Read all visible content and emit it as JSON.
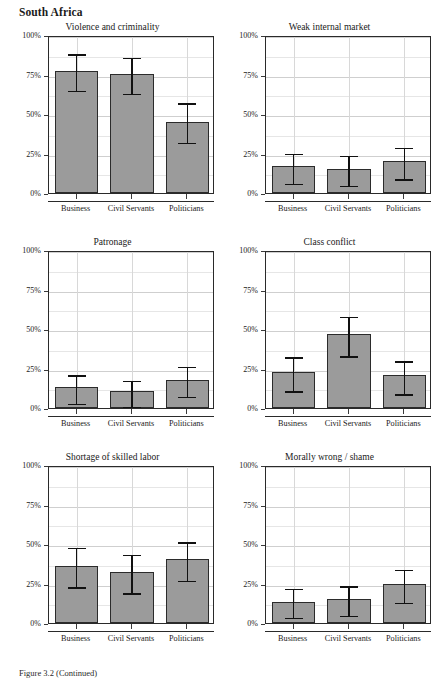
{
  "figure": {
    "country_title": "South Africa",
    "caption": "Figure 3.2 (Continued)"
  },
  "axis": {
    "y_tick_labels": [
      "0%",
      "25%",
      "50%",
      "75%",
      "100%"
    ],
    "y_tick_values": [
      0,
      25,
      50,
      75,
      100
    ],
    "y_minor_values": [
      12.5,
      37.5,
      62.5,
      87.5
    ],
    "x_categories": [
      "Business",
      "Civil Servants",
      "Politicians"
    ]
  },
  "colors": {
    "bar_fill": "#9b9b9b",
    "bar_stroke": "#2b2b2b",
    "error_bar": "#111111",
    "gridline": "#d8d8d8",
    "panel_border": "#2a2a2a",
    "text": "#1a1a1a"
  },
  "chart_data": {
    "type": "bar",
    "title": "South Africa",
    "xlabel": "",
    "ylabel": "",
    "ylim": [
      0,
      100
    ],
    "grid": true,
    "legend": "none",
    "units": "percent",
    "categories": [
      "Business",
      "Civil Servants",
      "Politicians"
    ],
    "error_bars": "95% confidence interval",
    "panels": [
      {
        "title": "Violence and criminality",
        "values": [
          77,
          75.5,
          45
        ],
        "ci_low": [
          66,
          64,
          33
        ],
        "ci_high": [
          89,
          87,
          58
        ]
      },
      {
        "title": "Weak internal market",
        "values": [
          17,
          15.5,
          20
        ],
        "ci_low": [
          7,
          6,
          10
        ],
        "ci_high": [
          26,
          25,
          30
        ]
      },
      {
        "title": "Patronage",
        "values": [
          13,
          11,
          18
        ],
        "ci_low": [
          4,
          2,
          8.5
        ],
        "ci_high": [
          22,
          18.5,
          27.5
        ]
      },
      {
        "title": "Class conflict",
        "values": [
          23,
          47,
          21
        ],
        "ci_low": [
          12,
          34,
          10
        ],
        "ci_high": [
          33.5,
          59,
          31
        ]
      },
      {
        "title": "Shortage of skilled labor",
        "values": [
          36,
          32,
          40.5
        ],
        "ci_low": [
          24,
          20,
          28
        ],
        "ci_high": [
          49,
          44.5,
          52.5
        ]
      },
      {
        "title": "Morally wrong / shame",
        "values": [
          13.5,
          15,
          24.5
        ],
        "ci_low": [
          4.5,
          6,
          14
        ],
        "ci_high": [
          23,
          24.5,
          35
        ]
      }
    ]
  }
}
